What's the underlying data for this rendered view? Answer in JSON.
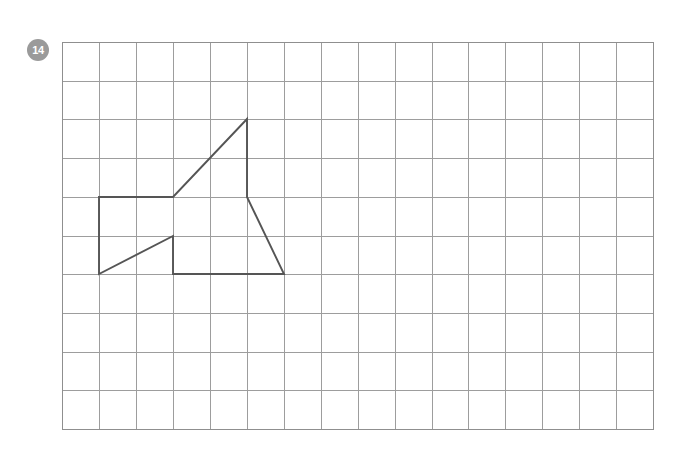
{
  "page": {
    "width": 680,
    "height": 460,
    "background_color": "#ffffff"
  },
  "badge": {
    "label": "14",
    "fill_color": "#9a9a9a",
    "text_color": "#ffffff",
    "shape": "circle"
  },
  "grid": {
    "origin_x": 62,
    "origin_y": 42,
    "cols": 16,
    "rows": 10,
    "cell_width": 36.95,
    "cell_height": 38.7,
    "line_color": "#9d9d9d",
    "border_color": "#8f8f8f"
  },
  "figure": {
    "name": "closed-polygon",
    "stroke_color": "#555555",
    "stroke_width": 1.9,
    "fill": "none",
    "closed": true,
    "vertices_grid": [
      [
        1,
        4
      ],
      [
        3,
        4
      ],
      [
        5,
        2
      ],
      [
        5,
        4
      ],
      [
        6,
        6
      ],
      [
        3,
        6
      ],
      [
        3,
        5
      ],
      [
        1,
        6
      ]
    ],
    "vertices_px": [
      [
        99,
        197
      ],
      [
        173,
        197
      ],
      [
        247,
        119
      ],
      [
        247,
        197
      ],
      [
        284,
        274
      ],
      [
        173,
        274
      ],
      [
        173,
        236
      ],
      [
        99,
        274
      ]
    ]
  },
  "chart_data": {
    "type": "table",
    "title": "",
    "xlabel": "",
    "ylabel": ""
  }
}
